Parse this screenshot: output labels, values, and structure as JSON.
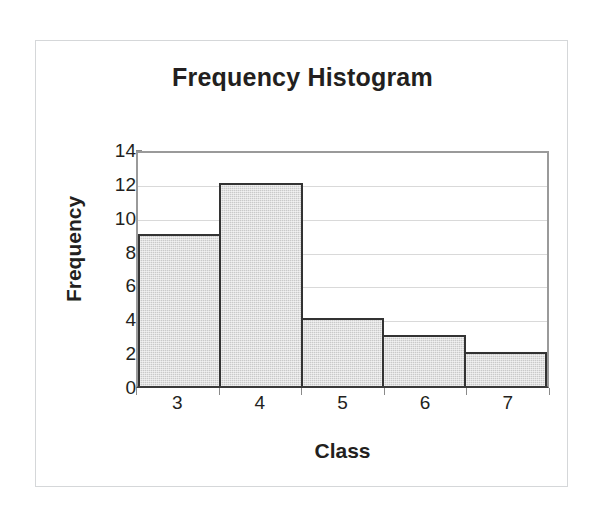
{
  "chart_data": {
    "type": "bar",
    "title": "Frequency Histogram",
    "xlabel": "Class",
    "ylabel": "Frequency",
    "categories": [
      "3",
      "4",
      "5",
      "6",
      "7"
    ],
    "values": [
      9,
      12,
      4,
      3,
      2
    ],
    "series": [
      {
        "name": "Frequency",
        "values": [
          9,
          12,
          4,
          3,
          2
        ]
      }
    ],
    "ylim": [
      0,
      14
    ],
    "ytick_labels": [
      "0",
      "2",
      "4",
      "6",
      "8",
      "10",
      "12",
      "14"
    ],
    "ytick_values": [
      0,
      2,
      4,
      6,
      8,
      10,
      12,
      14
    ],
    "grid": "horizontal",
    "legend": "none",
    "bar_gap": 0,
    "colors": {
      "bar_fill": "#c9c9c9",
      "bar_border": "#333333",
      "gridline": "#d9d9d9",
      "axis": "#9a9a9a",
      "baseline": "#3a3a3a",
      "text": "#231f20",
      "card_border": "#d5d7d9",
      "background": "#ffffff"
    }
  }
}
